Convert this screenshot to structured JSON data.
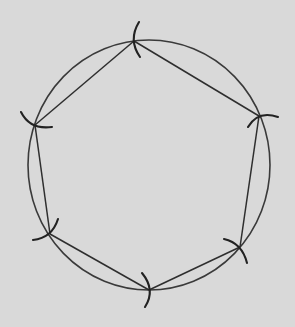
{
  "diagram": {
    "background": "#d9d9d9",
    "stroke_color": "#2e2e2e",
    "circle": {
      "cx": 149,
      "cy": 165,
      "rx": 121,
      "ry": 125
    },
    "vertices": [
      {
        "name": "top",
        "x": 134,
        "y": 41
      },
      {
        "name": "upper-right",
        "x": 259,
        "y": 116
      },
      {
        "name": "lower-right",
        "x": 240,
        "y": 247
      },
      {
        "name": "bottom",
        "x": 149,
        "y": 290
      },
      {
        "name": "lower-left",
        "x": 50,
        "y": 234
      },
      {
        "name": "upper-left",
        "x": 35,
        "y": 125
      }
    ],
    "arc_marks": [
      {
        "vertex": "top",
        "path": "M 139 22 Q 128 40 140 57"
      },
      {
        "vertex": "upper-right",
        "path": "M 248 127 Q 258 110 278 117"
      },
      {
        "vertex": "lower-right",
        "path": "M 224 239 Q 242 243 247 263"
      },
      {
        "vertex": "bottom",
        "path": "M 142 273 Q 156 290 145 307"
      },
      {
        "vertex": "lower-left",
        "path": "M 33 240 Q 52 238 58 219"
      },
      {
        "vertex": "upper-left",
        "path": "M 21 112 Q 30 130 52 127"
      }
    ]
  }
}
